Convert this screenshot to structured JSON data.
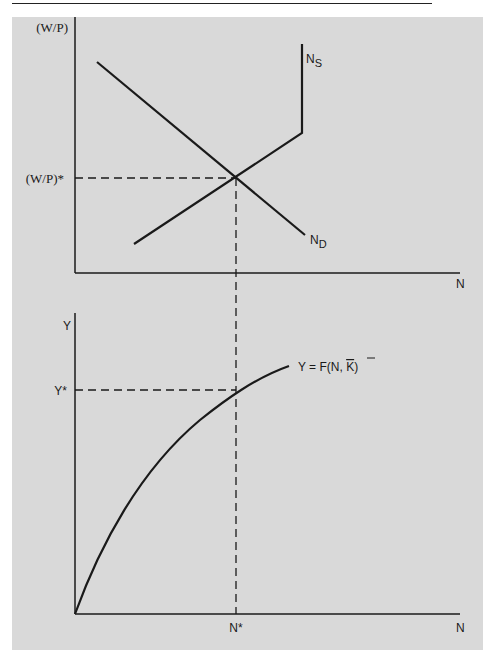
{
  "header": {
    "corner_mark": "g"
  },
  "colors": {
    "background": "#d9d9d9",
    "ink": "#1a1a1a"
  },
  "top_panel": {
    "y_axis_label": "(W/P)",
    "equilibrium_wage_label": "(W/P)*",
    "x_axis_label": "N",
    "supply_label": "N",
    "supply_subscript": "S",
    "demand_label": "N",
    "demand_subscript": "D"
  },
  "bottom_panel": {
    "y_axis_label": "Y",
    "equilibrium_output_label": "Y*",
    "x_axis_label": "N",
    "equilibrium_employment_label": "N*",
    "function_label_prefix": "Y = F(N, ",
    "function_label_capital": "K",
    "function_label_suffix": ")"
  }
}
